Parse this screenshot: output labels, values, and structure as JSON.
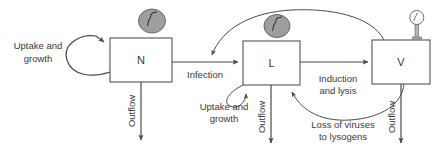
{
  "diagram": {
    "background_color": "#ffffff",
    "line_color": "#4a4a4a",
    "text_color": "#3a3a3a",
    "cell_fill_color": "#9e9e9e",
    "boxes": [
      {
        "id": "N",
        "label": "N",
        "meaning": "host-cell-compartment"
      },
      {
        "id": "L",
        "label": "L",
        "meaning": "lysogen-compartment"
      },
      {
        "id": "V",
        "label": "V",
        "meaning": "virus-compartment"
      }
    ],
    "flows": [
      {
        "id": "uptake-growth-n",
        "label_line1": "Uptake and",
        "label_line2": "growth"
      },
      {
        "id": "outflow-n",
        "label": "Outflow"
      },
      {
        "id": "infection",
        "label": "Infection"
      },
      {
        "id": "uptake-growth-l",
        "label_line1": "Uptake and",
        "label_line2": "growth"
      },
      {
        "id": "outflow-l",
        "label": "Outflow"
      },
      {
        "id": "induction-lysis",
        "label_line1": "Induction",
        "label_line2": "and lysis"
      },
      {
        "id": "loss-of-viruses",
        "label_line1": "Loss of viruses",
        "label_line2": "to lysogens"
      },
      {
        "id": "outflow-v",
        "label": "Outflow"
      }
    ],
    "icons": [
      {
        "id": "bacterium-above-n",
        "name": "bacterial-cell-icon"
      },
      {
        "id": "bacterium-above-l",
        "name": "lysogen-cell-icon"
      },
      {
        "id": "phage-above-v",
        "name": "bacteriophage-icon"
      }
    ]
  }
}
